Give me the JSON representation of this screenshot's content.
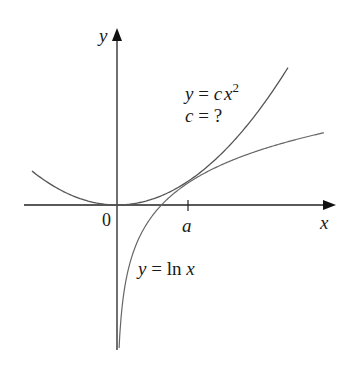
{
  "figure": {
    "axes": {
      "x_label": "x",
      "y_label": "y",
      "origin_label": "0",
      "tick_label": "a"
    },
    "curves": [
      {
        "name": "parabola",
        "equation_lhs": "y = c",
        "equation_var": "x",
        "equation_exp": "2",
        "note": "c = ?"
      },
      {
        "name": "logarithm",
        "equation": "y = ln x"
      }
    ],
    "colors": {
      "axis": "#222222",
      "curve": "#555555",
      "text": "#1a1a1a"
    }
  }
}
